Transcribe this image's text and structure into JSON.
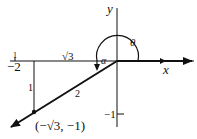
{
  "diagram": {
    "axes": {
      "x_label": "x",
      "y_label": "y"
    },
    "ticks": {
      "x_neg2": "−2",
      "x_tick_mark": "1",
      "y_neg1": "−1"
    },
    "triangle": {
      "horizontal_side": "√3",
      "vertical_side": "1",
      "hypotenuse": "2"
    },
    "angles": {
      "theta": "θ",
      "alpha": "α"
    },
    "point": {
      "label": "(−√3, −1)"
    },
    "colors": {
      "ink": "#111111",
      "background": "#ffffff"
    }
  }
}
